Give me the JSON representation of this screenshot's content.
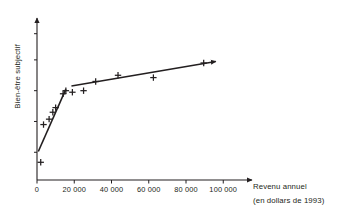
{
  "chart_data": {
    "type": "scatter",
    "title": "",
    "xlabel": "Revenu annuel",
    "xlabel_sub": "(en dollars de 1993)",
    "ylabel": "Bien-être subjectif",
    "xlim": [
      0,
      112000
    ],
    "ylim": [
      0,
      1
    ],
    "grid": false,
    "legend": null,
    "xticks": [
      0,
      20000,
      40000,
      60000,
      80000,
      100000
    ],
    "xticklabels": [
      "0",
      "20 000",
      "40 000",
      "60 000",
      "80 000",
      "100 000"
    ],
    "yticks": [],
    "yticklabels": [],
    "points": [
      {
        "x": 2000,
        "y": 0.115
      },
      {
        "x": 3500,
        "y": 0.36
      },
      {
        "x": 6500,
        "y": 0.395
      },
      {
        "x": 8500,
        "y": 0.44
      },
      {
        "x": 10000,
        "y": 0.47
      },
      {
        "x": 14000,
        "y": 0.56
      },
      {
        "x": 15500,
        "y": 0.58
      },
      {
        "x": 19000,
        "y": 0.57
      },
      {
        "x": 25000,
        "y": 0.58
      },
      {
        "x": 31500,
        "y": 0.64
      },
      {
        "x": 43500,
        "y": 0.68
      },
      {
        "x": 62500,
        "y": 0.665
      },
      {
        "x": 89500,
        "y": 0.76
      }
    ],
    "fit_lines": [
      {
        "name": "segment-steep",
        "x0": 700,
        "y0": 0.185,
        "x1": 15500,
        "y1": 0.59,
        "arrow": false
      },
      {
        "name": "segment-plateau",
        "x0": 18500,
        "y0": 0.61,
        "x1": 96000,
        "y1": 0.77,
        "arrow": true
      }
    ],
    "marker": "plus",
    "marker_color": "#231f20",
    "line_color": "#231f20",
    "axis_color": "#231f20",
    "background": "#ffffff"
  },
  "axes": {
    "x_arrow": true,
    "y_arrow": true
  }
}
